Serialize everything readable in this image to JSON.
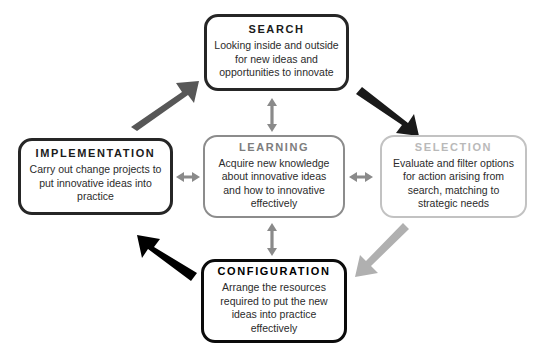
{
  "diagram": {
    "nodes": [
      {
        "id": "search",
        "title": "SEARCH",
        "body": "Looking inside and outside for new ideas and opportunities to innovate",
        "border_color": "#262626",
        "title_color": "#1b1b1b"
      },
      {
        "id": "implementation",
        "title": "IMPLEMENTATION",
        "body": "Carry out change projects to put innovative ideas into practice",
        "border_color": "#262626",
        "title_color": "#1b1b1b"
      },
      {
        "id": "learning",
        "title": "LEARNING",
        "body": "Acquire new knowledge about innovative ideas and how to innovative effectively",
        "border_color": "#8c8c8c",
        "title_color": "#7d7d7d"
      },
      {
        "id": "selection",
        "title": "SELECTION",
        "body": "Evaluate and filter options for action arising from search, matching to strategic needs",
        "border_color": "#c2c2c2",
        "title_color": "#b9b9b9"
      },
      {
        "id": "configuration",
        "title": "CONFIGURATION",
        "body": "Arrange the resources required to put the new ideas into practice effectively",
        "border_color": "#0b0b0b",
        "title_color": "#000000"
      }
    ],
    "arrows": [
      {
        "id": "implementation-to-search",
        "from": "implementation",
        "to": "search",
        "direction": "up-right",
        "color": "#575757",
        "style": "single-head"
      },
      {
        "id": "search-to-selection",
        "from": "search",
        "to": "selection",
        "direction": "down-right",
        "color": "#1a1a1a",
        "style": "single-head"
      },
      {
        "id": "selection-to-configuration",
        "from": "selection",
        "to": "configuration",
        "direction": "down-left",
        "color": "#b0b0b0",
        "style": "single-head"
      },
      {
        "id": "configuration-to-implementation",
        "from": "configuration",
        "to": "implementation",
        "direction": "up-left",
        "color": "#000000",
        "style": "single-head"
      },
      {
        "id": "search-learning",
        "from": "search",
        "to": "learning",
        "direction": "vertical",
        "color": "#8a8a8a",
        "style": "double-head"
      },
      {
        "id": "implementation-learning",
        "from": "implementation",
        "to": "learning",
        "direction": "horizontal",
        "color": "#8a8a8a",
        "style": "double-head"
      },
      {
        "id": "learning-selection",
        "from": "learning",
        "to": "selection",
        "direction": "horizontal",
        "color": "#8a8a8a",
        "style": "double-head"
      },
      {
        "id": "learning-configuration",
        "from": "learning",
        "to": "configuration",
        "direction": "vertical",
        "color": "#8a8a8a",
        "style": "double-head"
      }
    ]
  }
}
